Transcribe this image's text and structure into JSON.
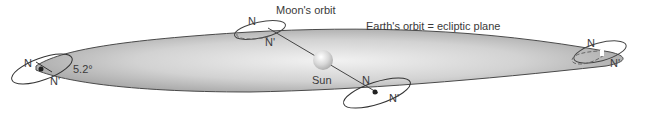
{
  "diagram": {
    "title_labels": {
      "moons_orbit": "Moon's orbit",
      "earths_orbit": "Earth's orbit = ecliptic plane"
    },
    "sun_label": "Sun",
    "inclination_angle": "5.2°",
    "node_labels": {
      "ascending": "N",
      "descending": "N'"
    },
    "positions": [
      {
        "id": "left",
        "node_n": "N",
        "node_n_prime": "N'",
        "angle": "5.2°"
      },
      {
        "id": "top-center",
        "node_n": "N",
        "node_n_prime": "N'"
      },
      {
        "id": "bottom-center",
        "node_n": "N",
        "node_n_prime": "N'"
      },
      {
        "id": "right",
        "node_n": "N",
        "node_n_prime": "N'"
      }
    ],
    "colors": {
      "plane_dark": "#a9a9a9",
      "plane_light": "#efefef",
      "outline": "#4a4a4a",
      "text": "#3a3a3a"
    }
  }
}
